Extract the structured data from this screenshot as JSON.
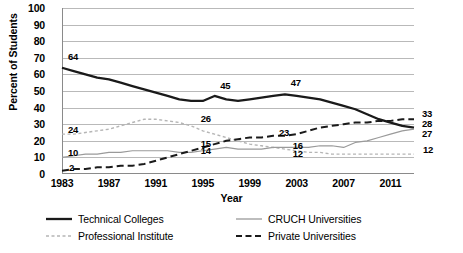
{
  "chart_data": {
    "type": "line",
    "title": "",
    "xlabel": "Year",
    "ylabel": "Percent of Students",
    "xlim": [
      1983,
      2013
    ],
    "ylim": [
      0,
      100
    ],
    "ytick_labels": [
      "100",
      "90",
      "80",
      "70",
      "60",
      "50",
      "40",
      "30",
      "20",
      "10",
      "0"
    ],
    "ytick_values": [
      100,
      90,
      80,
      70,
      60,
      50,
      40,
      30,
      20,
      10,
      0
    ],
    "xtick_labels": [
      "1983",
      "1987",
      "1991",
      "1995",
      "1999",
      "2003",
      "2007",
      "2011"
    ],
    "xtick_values": [
      1983,
      1987,
      1991,
      1995,
      1999,
      2003,
      2007,
      2011
    ],
    "grid": "horizontal",
    "legend_position": "bottom",
    "x": [
      1983,
      1984,
      1985,
      1986,
      1987,
      1988,
      1989,
      1990,
      1991,
      1992,
      1993,
      1994,
      1995,
      1996,
      1997,
      1998,
      1999,
      2000,
      2001,
      2002,
      2003,
      2004,
      2005,
      2006,
      2007,
      2008,
      2009,
      2010,
      2011,
      2012,
      2013
    ],
    "series": [
      {
        "name": "Technical Colleges",
        "style": "solid",
        "color": "#1a1a1a",
        "width": 2.3,
        "values": [
          64,
          62,
          60,
          58,
          57,
          55,
          53,
          51,
          49,
          47,
          45,
          44,
          44,
          47,
          45,
          44,
          45,
          46,
          47,
          48,
          47,
          46,
          45,
          43,
          41,
          39,
          36,
          33,
          31,
          29,
          28
        ]
      },
      {
        "name": "Professional Institute",
        "style": "fine-dashed",
        "color": "#b5b5b5",
        "width": 1.4,
        "values": [
          24,
          24,
          25,
          26,
          27,
          29,
          31,
          33,
          33,
          32,
          31,
          29,
          26,
          24,
          22,
          20,
          18,
          17,
          16,
          15,
          14,
          13,
          13,
          12,
          12,
          12,
          12,
          12,
          12,
          12,
          12
        ]
      },
      {
        "name": "CRUCH Universities",
        "style": "solid",
        "color": "#9a9a9a",
        "width": 1.2,
        "values": [
          10,
          11,
          12,
          12,
          13,
          13,
          14,
          14,
          14,
          14,
          13,
          13,
          14,
          15,
          16,
          15,
          15,
          15,
          16,
          16,
          16,
          16,
          17,
          17,
          16,
          19,
          20,
          22,
          24,
          26,
          27
        ]
      },
      {
        "name": "Private Universities",
        "style": "dashed",
        "color": "#1a1a1a",
        "width": 2.0,
        "values": [
          2,
          3,
          3,
          4,
          4,
          5,
          5,
          6,
          8,
          10,
          12,
          14,
          16,
          18,
          20,
          21,
          22,
          22,
          23,
          23,
          24,
          26,
          28,
          29,
          30,
          31,
          31,
          32,
          32,
          33,
          33
        ]
      }
    ],
    "annotations": [
      {
        "text": "64",
        "x": 1983,
        "y": 64,
        "dx": 6,
        "dy": -11
      },
      {
        "text": "45",
        "x": 1997,
        "y": 45,
        "dx": -6,
        "dy": -13
      },
      {
        "text": "47",
        "x": 2003,
        "y": 47,
        "dx": -6,
        "dy": -13
      },
      {
        "text": "24",
        "x": 1983,
        "y": 24,
        "dx": 6,
        "dy": -4
      },
      {
        "text": "26",
        "x": 1995,
        "y": 26,
        "dx": -2,
        "dy": -12
      },
      {
        "text": "10",
        "x": 1983,
        "y": 10,
        "dx": 6,
        "dy": -4
      },
      {
        "text": "14",
        "x": 1995,
        "y": 14,
        "dx": -2,
        "dy": 0
      },
      {
        "text": "16",
        "x": 2003,
        "y": 16,
        "dx": -4,
        "dy": -1
      },
      {
        "text": "2",
        "x": 1983,
        "y": 2,
        "dx": 7,
        "dy": -3
      },
      {
        "text": "15",
        "x": 1995,
        "y": 16,
        "dx": -2,
        "dy": -3
      },
      {
        "text": "23",
        "x": 2002,
        "y": 23,
        "dx": -6,
        "dy": -3
      },
      {
        "text": "12",
        "x": 2003,
        "y": 12,
        "dx": -4,
        "dy": 0
      },
      {
        "text": "33",
        "x": 2013,
        "y": 33,
        "dx": 8,
        "dy": -5
      },
      {
        "text": "28",
        "x": 2013,
        "y": 28,
        "dx": 8,
        "dy": -4
      },
      {
        "text": "27",
        "x": 2013,
        "y": 27,
        "dx": 8,
        "dy": 5
      },
      {
        "text": "12",
        "x": 2013,
        "y": 12,
        "dx": 9,
        "dy": -4
      }
    ]
  },
  "legend": {
    "items": [
      {
        "label": "Technical Colleges",
        "style": "solid",
        "color": "#1a1a1a"
      },
      {
        "label": "CRUCH Universities",
        "style": "solid-thin",
        "color": "#9a9a9a"
      },
      {
        "label": "Professional Institute",
        "style": "fine-dashed",
        "color": "#b5b5b5"
      },
      {
        "label": "Private Universities",
        "style": "dashed",
        "color": "#1a1a1a"
      }
    ]
  },
  "colors": {
    "grid": "#b9b9b9",
    "axis": "#8a8a8a",
    "background": "#ffffff",
    "text": "#000000"
  }
}
